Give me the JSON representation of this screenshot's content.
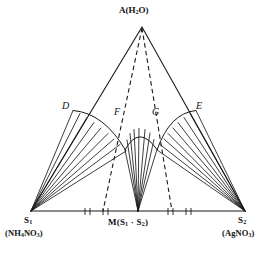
{
  "figure": {
    "type": "ternary-phase-diagram",
    "title": "",
    "background_color": "#ffffff",
    "stroke_color": "#1a1a1a"
  },
  "vertices": {
    "apex": {
      "name": "A",
      "label_html": "A(H<sub>2</sub>O)",
      "label_text": "A(H2O)",
      "component": "H2O",
      "x": 142,
      "y": 22
    },
    "bottom_left": {
      "name": "S1",
      "label_html": "S<sub>1</sub>",
      "label_text": "S1",
      "formula_html": "(NH<sub>4</sub>NO<sub>3</sub>)",
      "formula_text": "(NH4NO3)",
      "x": 31,
      "y": 211
    },
    "bottom_right": {
      "name": "S2",
      "label_html": "S<sub>2</sub>",
      "label_text": "S2",
      "formula_html": "(AgNO<sub>3</sub>)",
      "formula_text": "(AgNO3)",
      "x": 245,
      "y": 211
    },
    "bottom_center": {
      "name": "M",
      "label_html": "M(S<sub>1</sub> &middot; S<sub>2</sub>)",
      "label_text": "M(S1 . S2)",
      "description": "double salt",
      "x": 138,
      "y": 211
    }
  },
  "arc_points": [
    {
      "name": "D",
      "label": "D",
      "x": 73,
      "y": 110,
      "role": "left-arc-start"
    },
    {
      "name": "F",
      "label": "F",
      "x": 124,
      "y": 117,
      "role": "left-arc-end"
    },
    {
      "name": "G",
      "label": "G",
      "x": 157,
      "y": 117,
      "role": "right-arc-start"
    },
    {
      "name": "E",
      "label": "E",
      "x": 196,
      "y": 110,
      "role": "right-arc-end"
    }
  ],
  "fans": [
    {
      "name": "left-fan",
      "origin": "S1",
      "arc": "D-F",
      "ray_count": 9
    },
    {
      "name": "center-fan",
      "origin": "M",
      "arc": "F-G",
      "ray_count": 9
    },
    {
      "name": "right-fan",
      "origin": "S2",
      "arc": "G-E",
      "ray_count": 9
    }
  ],
  "dashed_lines": [
    {
      "name": "apex-to-left-boundary",
      "from": "A",
      "to_x": 103,
      "to_y": 211
    },
    {
      "name": "apex-to-right-boundary",
      "from": "A",
      "to_x": 172,
      "to_y": 211
    }
  ],
  "baseline_ticks": [
    {
      "x": 85
    },
    {
      "x": 90
    },
    {
      "x": 103
    },
    {
      "x": 108
    },
    {
      "x": 168
    },
    {
      "x": 173
    },
    {
      "x": 186
    },
    {
      "x": 191
    }
  ]
}
